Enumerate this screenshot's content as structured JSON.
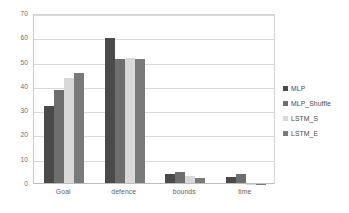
{
  "chart_data": {
    "type": "bar",
    "title": "",
    "subtitle": "",
    "xlabel": "",
    "ylabel": "",
    "categories": [
      "Goal",
      "defence",
      "bounds",
      "time"
    ],
    "series": [
      {
        "name": "MLP",
        "color": "#4a4a4a",
        "values": [
          32.0,
          60.0,
          4.3,
          3.0
        ]
      },
      {
        "name": "MLP_Shuffle",
        "color": "#6e6e6e",
        "values": [
          38.8,
          51.5,
          5.0,
          4.3
        ]
      },
      {
        "name": "LSTM_S",
        "color": "#d9d9d9",
        "values": [
          43.5,
          52.0,
          3.3,
          0.2
        ]
      },
      {
        "name": "LSTM_E",
        "color": "#7a7a7a",
        "values": [
          45.8,
          51.3,
          2.5,
          0.2
        ]
      }
    ],
    "ylim": [
      0,
      70
    ],
    "yticks": [
      0,
      10,
      20,
      30,
      40,
      50,
      60,
      70
    ],
    "ytick_labels": [
      "0",
      "10",
      "20",
      "30",
      "40",
      "50",
      "60",
      "70"
    ],
    "grid": true,
    "grid_axis": "y",
    "legend_position": "right",
    "legend_entries": [
      "MLP",
      "MLP_Shuffle",
      "LSTM_S",
      "LSTM_E"
    ],
    "annotations": [],
    "colors": {
      "gridline": "#d9d9d9",
      "axis": "#bdbdbd",
      "tick_text": "#6d6d6d",
      "legend_text": "#4a4a4a",
      "background": "#ffffff"
    }
  }
}
